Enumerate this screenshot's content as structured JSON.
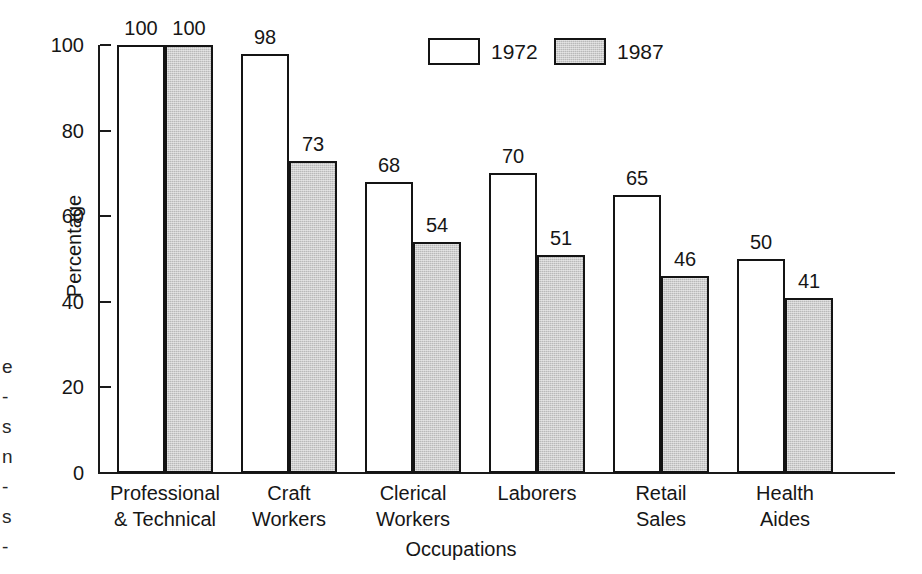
{
  "chart_data": {
    "type": "bar",
    "title": "",
    "xlabel": "Occupations",
    "ylabel": "Percentage",
    "categories": [
      "Professional\n& Technical",
      "Craft\nWorkers",
      "Clerical\nWorkers",
      "Laborers",
      "Retail\nSales",
      "Health\nAides"
    ],
    "series": [
      {
        "name": "1972",
        "values": [
          100,
          98,
          68,
          70,
          65,
          50
        ],
        "fill": "#ffffff",
        "stroke": "#141414"
      },
      {
        "name": "1987",
        "values": [
          100,
          73,
          54,
          51,
          46,
          41
        ],
        "fill": "#b9b9b9",
        "stroke": "#141414"
      }
    ],
    "ylim": [
      0,
      100
    ],
    "yticks": [
      0,
      20,
      40,
      60,
      80,
      100
    ],
    "ytick_labels": [
      "0",
      "20",
      "40",
      "60",
      "80",
      "100"
    ],
    "grid": false,
    "data_labels": true,
    "legend": {
      "position": "top-center",
      "entries": [
        "1972",
        "1987"
      ]
    }
  },
  "legend": {
    "items": [
      {
        "label": "1972",
        "swatch": "white-swatch-icon"
      },
      {
        "label": "1987",
        "swatch": "gray-swatch-icon"
      }
    ]
  },
  "axes": {
    "y_title": "Percentage",
    "x_title": "Occupations"
  },
  "page_edge_fragments": [
    "e",
    "-",
    "s",
    "n",
    "-",
    "s",
    "-"
  ]
}
